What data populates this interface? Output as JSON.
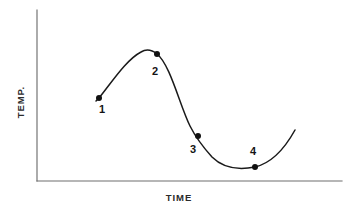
{
  "figure": {
    "background_color": "#ffffff",
    "width": 358,
    "height": 216
  },
  "axes": {
    "x_label": "TIME",
    "y_label": "TEMP.",
    "axis_color": "#6e6e6e",
    "x_axis": {
      "x_start": 37,
      "x_end": 342,
      "y": 181
    },
    "y_axis": {
      "x": 37,
      "y_start": 10,
      "y_end": 181
    }
  },
  "curve": {
    "color": "#1a1a1a",
    "stroke_width": 1.5,
    "path": "M 96 101 L 99 98 C 112 82 126 60 141 52 C 146 49 152 50 157 54 C 170 64 180 106 190 126 C 196 138 203 147 212 157 C 224 169 240 170 255 167 C 272 163 285 148 295 130"
  },
  "markers": {
    "color": "#111111",
    "radius": 3.0
  },
  "chart_data": {
    "type": "line",
    "title": "",
    "subtitle": "",
    "xlabel": "TIME",
    "ylabel": "TEMP.",
    "grid": false,
    "legend": "none",
    "axis_ticks": {
      "x": [],
      "y": []
    },
    "axis_ranges": {
      "xlim": [
        0,
        1
      ],
      "ylim": [
        0,
        1
      ]
    },
    "points": [
      {
        "label": "1",
        "px": 99,
        "py": 98,
        "phase": "rising",
        "label_position": "below-right"
      },
      {
        "label": "2",
        "px": 157,
        "py": 54,
        "phase": "just past peak",
        "label_position": "below-left"
      },
      {
        "label": "3",
        "px": 198,
        "py": 136,
        "phase": "falling inflection",
        "label_position": "below-left"
      },
      {
        "label": "4",
        "px": 255,
        "py": 167,
        "phase": "trough / minimum",
        "label_position": "above"
      }
    ],
    "series": [
      {
        "name": "temperature",
        "x": [
          0.19,
          0.36,
          0.39,
          0.53,
          0.71,
          0.85,
          1.0
        ],
        "values": [
          0.49,
          0.76,
          0.74,
          0.26,
          0.08,
          0.08,
          0.3
        ]
      }
    ]
  }
}
